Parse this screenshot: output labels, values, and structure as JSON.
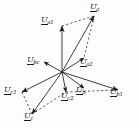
{
  "figure": {
    "background_color": "#fdfdfd",
    "stroke_color": "#1a1a1a",
    "origin": {
      "x": 62,
      "y": 72
    }
  },
  "chart_data": {
    "type": "scatter",
    "title": "",
    "xlabel": "",
    "ylabel": "",
    "subtype": "phasor-vector-diagram",
    "grid": false,
    "legend": false,
    "origin": {
      "x": 62,
      "y": 72
    },
    "xlim": [
      0,
      138
    ],
    "ylim": [
      0,
      128
    ],
    "vectors": [
      {
        "name": "U_a",
        "label_base": "U",
        "label_sub": "a",
        "x2": 94,
        "y2": 16,
        "style": "solid",
        "label_x": 90,
        "label_y": 3
      },
      {
        "name": "U_a1",
        "label_base": "U",
        "label_sub": "a1",
        "x2": 62,
        "y2": 26,
        "style": "solid",
        "label_x": 41,
        "label_y": 16
      },
      {
        "name": "U_a2",
        "label_base": "U",
        "label_sub": "a2",
        "x2": 84,
        "y2": 58,
        "style": "solid",
        "label_x": 80,
        "label_y": 58
      },
      {
        "name": "U_bc",
        "label_base": "U",
        "label_sub": "bc",
        "x2": 44,
        "y2": 62,
        "style": "solid",
        "label_x": 27,
        "label_y": 56
      },
      {
        "name": "U_b",
        "label_base": "U",
        "label_sub": "b",
        "x2": 84,
        "y2": 88,
        "style": "solid",
        "label_x": 76,
        "label_y": 86
      },
      {
        "name": "U_b1",
        "label_base": "U",
        "label_sub": "b1",
        "x2": 118,
        "y2": 90,
        "style": "solid",
        "label_x": 110,
        "label_y": 88
      },
      {
        "name": "U_c2",
        "label_base": "U",
        "label_sub": "c2",
        "x2": 66,
        "y2": 92,
        "style": "solid",
        "label_x": 61,
        "label_y": 92
      },
      {
        "name": "U_c1",
        "label_base": "U",
        "label_sub": "c1",
        "x2": 22,
        "y2": 92,
        "style": "solid",
        "label_x": 4,
        "label_y": 86
      },
      {
        "name": "U_c",
        "label_base": "U",
        "label_sub": "c",
        "x2": 32,
        "y2": 114,
        "style": "solid",
        "label_x": 24,
        "label_y": 112
      }
    ],
    "construction_lines": [
      {
        "name": "Ua-to-Ua2",
        "x1": 94,
        "y1": 16,
        "x2": 84,
        "y2": 58,
        "style": "dashed"
      },
      {
        "name": "Ua1-to-Ua",
        "x1": 62,
        "y1": 26,
        "x2": 94,
        "y2": 16,
        "style": "dashed"
      },
      {
        "name": "Uc-to-Uc2",
        "x1": 32,
        "y1": 114,
        "x2": 66,
        "y2": 92,
        "style": "dashed"
      },
      {
        "name": "Uc1-to-Uc",
        "x1": 22,
        "y1": 92,
        "x2": 32,
        "y2": 114,
        "style": "dashed"
      },
      {
        "name": "Uc2-to-Ub1",
        "x1": 66,
        "y1": 92,
        "x2": 118,
        "y2": 90,
        "style": "dashed"
      }
    ]
  }
}
